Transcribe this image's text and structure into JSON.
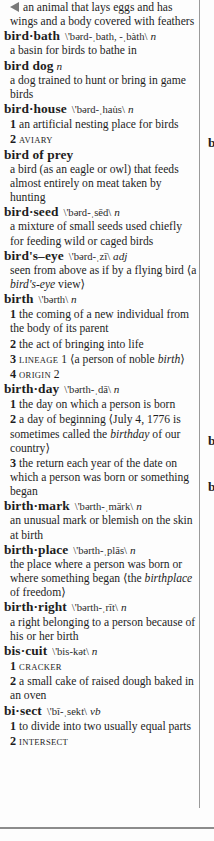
{
  "continuation": {
    "icon": "continuation-arrow-icon",
    "lines": "an animal that lays eggs and has wings and a body covered with feathers"
  },
  "entries": [
    {
      "headword": "bird·bath",
      "pron": "\\'bərd-ˌbath, -ˌbàth\\",
      "pos": "n",
      "defs": [
        {
          "text": "a basin for birds to bathe in"
        }
      ]
    },
    {
      "headword": "bird dog",
      "pron": "",
      "pos": "n",
      "defs": [
        {
          "text": "a dog trained to hunt or bring in game birds"
        }
      ]
    },
    {
      "headword": "bird·house",
      "pron": "\\'bərd-ˌhau̇s\\",
      "pos": "n",
      "defs": [
        {
          "num": "1",
          "text": "an artificial nesting place for birds"
        },
        {
          "num": "2",
          "xref": "aviary"
        }
      ]
    },
    {
      "headword": "bird of prey",
      "pron": "",
      "pos": "",
      "defs": [
        {
          "text": "a bird (as an eagle or owl) that feeds almost entirely on meat taken by hunting"
        }
      ]
    },
    {
      "headword": "bird·seed",
      "pron": "\\'bərd-ˌsēd\\",
      "pos": "n",
      "defs": [
        {
          "text": "a mixture of small seeds used chiefly for feeding wild or caged birds"
        }
      ]
    },
    {
      "headword": "bird's–eye",
      "pron": "\\'bərd-ˌzī\\",
      "pos": "adj",
      "defs": [
        {
          "text_pre": "seen from above as if by a flying bird ⟨a ",
          "italic": "bird's-eye",
          "text_post": " view⟩"
        }
      ]
    },
    {
      "headword": "birth",
      "pron": "\\'bərth\\",
      "pos": "n",
      "defs": [
        {
          "num": "1",
          "text": "the coming of a new individual from the body of its parent"
        },
        {
          "num": "2",
          "text": "the act of bringing into life"
        },
        {
          "num": "3",
          "xref": "lineage",
          "xref_num": " 1",
          "text_pre": " ⟨a person of noble ",
          "italic": "birth",
          "text_post": "⟩"
        },
        {
          "num": "4",
          "xref": "origin",
          "xref_num": " 2"
        }
      ]
    },
    {
      "headword": "birth·day",
      "pron": "\\'bərth-ˌdā\\",
      "pos": "n",
      "defs": [
        {
          "num": "1",
          "text": "the day on which a person is born"
        },
        {
          "num": "2",
          "text_pre": "a day of beginning ⟨July 4, 1776 is sometimes called the ",
          "italic": "birthday",
          "text_post": " of our country⟩"
        },
        {
          "num": "3",
          "text": "the return each year of the date on which a person was born or something began"
        }
      ]
    },
    {
      "headword": "birth·mark",
      "pron": "\\'bərth-ˌmärk\\",
      "pos": "n",
      "defs": [
        {
          "text": "an unusual mark or blemish on the skin at birth"
        }
      ]
    },
    {
      "headword": "birth·place",
      "pron": "\\'bərth-ˌplās\\",
      "pos": "n",
      "defs": [
        {
          "text_pre": "the place where a person was born or where something began ⟨the ",
          "italic": "birthplace",
          "text_post": " of freedom⟩"
        }
      ]
    },
    {
      "headword": "birth·right",
      "pron": "\\'bərth-ˌrīt\\",
      "pos": "n",
      "defs": [
        {
          "text": "a right belonging to a person because of his or her birth"
        }
      ]
    },
    {
      "headword": "bis·cuit",
      "pron": "\\'bis-kət\\",
      "pos": "n",
      "defs": [
        {
          "num": "1",
          "xref": "cracker"
        },
        {
          "num": "2",
          "text": "a small cake of raised dough baked in an oven"
        }
      ]
    },
    {
      "headword": "bi·sect",
      "pron": "\\'bī-ˌsekt\\",
      "pos": "vb",
      "defs": [
        {
          "num": "1",
          "text": "to divide into two usually equal parts"
        },
        {
          "num": "2",
          "xref": "intersect"
        }
      ]
    }
  ],
  "next_column_fragments": [
    {
      "text": "b",
      "top": 136
    },
    {
      "text": "b",
      "top": 434
    },
    {
      "text": "b",
      "top": 480
    }
  ],
  "colors": {
    "text": "#1e1e1e",
    "rule": "#9a9a9a",
    "arrow": "#7a7a7a",
    "paper": "#fdfdfd"
  }
}
